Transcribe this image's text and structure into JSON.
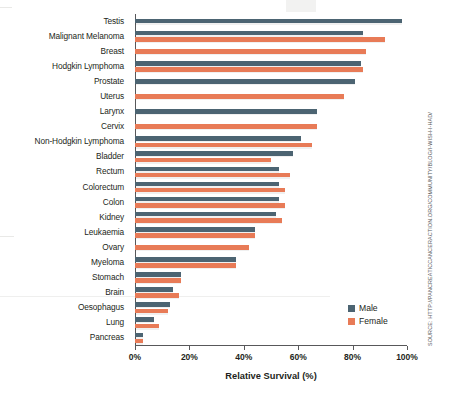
{
  "chart_data": {
    "type": "bar",
    "orientation": "horizontal",
    "title": "",
    "xlabel": "Relative Survival (%)",
    "ylabel": "",
    "xlim": [
      0,
      100
    ],
    "xticks": [
      0,
      20,
      40,
      60,
      80,
      100
    ],
    "xtick_labels": [
      "0%",
      "20%",
      "40%",
      "60%",
      "80%",
      "100%"
    ],
    "grid": false,
    "legend_position": "bottom-right",
    "categories": [
      "Testis",
      "Malignant Melanoma",
      "Breast",
      "Hodgkin Lymphoma",
      "Prostate",
      "Uterus",
      "Larynx",
      "Cervix",
      "Non-Hodgkin Lymphoma",
      "Bladder",
      "Rectum",
      "Colorectum",
      "Colon",
      "Kidney",
      "Leukaemia",
      "Ovary",
      "Myeloma",
      "Stomach",
      "Brain",
      "Oesophagus",
      "Lung",
      "Pancreas"
    ],
    "series": [
      {
        "name": "Male",
        "color": "#4c6472",
        "values": [
          98,
          84,
          null,
          83,
          81,
          null,
          67,
          null,
          61,
          58,
          53,
          53,
          53,
          52,
          44,
          null,
          37,
          17,
          14,
          13,
          7,
          3
        ]
      },
      {
        "name": "Female",
        "color": "#e87b57",
        "values": [
          null,
          92,
          85,
          84,
          null,
          77,
          null,
          67,
          65,
          50,
          57,
          55,
          55,
          54,
          44,
          42,
          37,
          17,
          16,
          12,
          9,
          3
        ]
      }
    ]
  },
  "legend": {
    "items": [
      {
        "label": "Male",
        "color": "#4c6472"
      },
      {
        "label": "Female",
        "color": "#e87b57"
      }
    ]
  },
  "axis": {
    "x_title": "Relative Survival (%)"
  },
  "source": {
    "credit": "SOURCE: HTTP://PANCREATICCANCERACTION.ORG/COMMUNITY/BLOG/I-WISH-I-HAD/"
  }
}
